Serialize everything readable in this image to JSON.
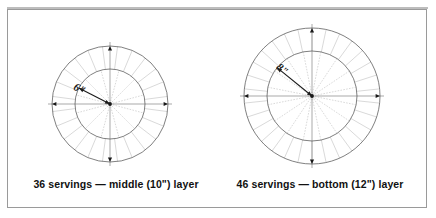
{
  "figure": {
    "background_color": "#ffffff",
    "frame_color": "#9a9a9a",
    "ink_color": "#1a1a1a",
    "guide_color": "#b9b9b9",
    "panels": [
      {
        "id": "middle-layer",
        "caption": "36 servings — middle (10\") layer",
        "servings": 36,
        "layer_name": "middle",
        "layer_size": "10\"",
        "radius_label": "6\"",
        "center_x": 110,
        "center_y": 104,
        "outer_radius": 58,
        "inner_radius": 35,
        "outer_segments": 24,
        "inner_segments": 12,
        "outer_offset_deg": 7.5,
        "label_angle_deg": 153,
        "label_x": 78,
        "label_y": 92
      },
      {
        "id": "bottom-layer",
        "caption": "46 servings — bottom (12\") layer",
        "servings": 46,
        "layer_name": "bottom",
        "layer_size": "12\"",
        "radius_label": "8\"",
        "center_x": 312,
        "center_y": 96,
        "outer_radius": 68,
        "inner_radius": 45,
        "outer_segments": 30,
        "inner_segments": 16,
        "outer_offset_deg": 6,
        "label_angle_deg": 141,
        "label_x": 280,
        "label_y": 72
      }
    ]
  },
  "captions": {
    "left": "36 servings — middle (10\") layer",
    "right": "46 servings — bottom (12\") layer"
  },
  "chart_data": {
    "type": "diagram",
    "series": [
      {
        "name": "36 servings — middle (10\") layer",
        "cake_diameter_in": 10,
        "radius_in": 6,
        "servings": 36,
        "outer_ring_pieces": 24,
        "inner_circle_pieces": 12
      },
      {
        "name": "46 servings — bottom (12\") layer",
        "cake_diameter_in": 12,
        "radius_in": 8,
        "servings": 46,
        "outer_ring_pieces": 30,
        "inner_circle_pieces": 16
      }
    ],
    "legend_position": "below",
    "grid": false
  }
}
